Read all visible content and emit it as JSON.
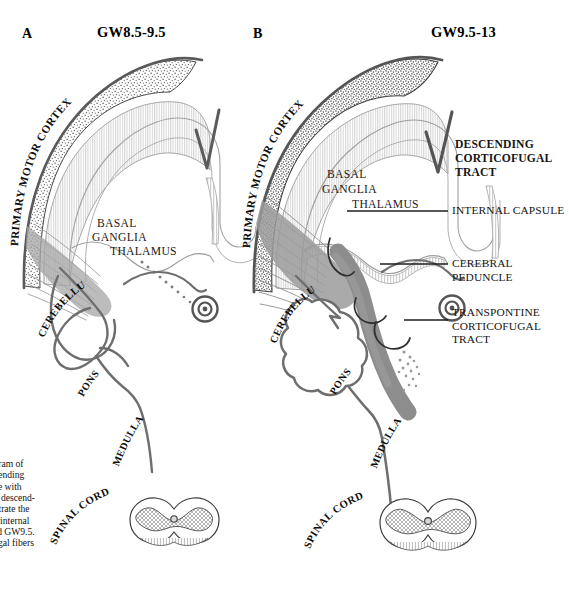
{
  "figure": {
    "panels": [
      {
        "letter": "A",
        "title": "GW8.5-9.5",
        "structure_labels": [
          "PRIMARY MOTOR CORTEX",
          "BASAL",
          "GANGLIA",
          "THALAMUS",
          "CEREBELLUM",
          "PONS",
          "MEDULLA",
          "SPINAL CORD"
        ]
      },
      {
        "letter": "B",
        "title": "GW9.5-13",
        "structure_labels": [
          "PRIMARY MOTOR CORTEX",
          "BASAL",
          "GANGLIA",
          "THALAMUS",
          "CEREBELLUM",
          "PONS",
          "MEDULLA",
          "SPINAL CORD"
        ]
      }
    ],
    "callouts": [
      {
        "id": "descending-corticofugal-tract",
        "text": "DESCENDING\nCORTICOFUGAL\nTRACT",
        "bold": true
      },
      {
        "id": "internal-capsule",
        "text": "INTERNAL CAPSULE",
        "bold": false
      },
      {
        "id": "cerebral-peduncle",
        "text": "CEREBRAL PEDUNCLE",
        "bold": false
      },
      {
        "id": "transpontine-corticofugal-tract",
        "text": "TRANSPONTINE\nCORTICOFUGAL\nTRACT",
        "bold": false
      }
    ],
    "caption": {
      "line1": "  Summary diagram of",
      "line2": "ing of the descending",
      "line3": "tract.  (Compare with",
      "line4_bold": "A.",
      "line4": " The earliest descend-",
      "line5": "gal fibers penetrate the",
      "line6": "a and form the internal",
      "line7": "een GW8.5 and GW9.5.",
      "line8": "n the corticofugal fibers"
    },
    "colors": {
      "tract_gray": "#8d8d8d",
      "outline_gray": "#6f6f6f",
      "outline_dark": "#4a4a4a",
      "text_black": "#111111",
      "background": "#ffffff"
    }
  }
}
